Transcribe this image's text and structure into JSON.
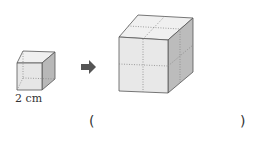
{
  "figure": {
    "small_cube_label": "2 cm",
    "answer_open": "(",
    "answer_close": ")",
    "answer_value": ""
  }
}
